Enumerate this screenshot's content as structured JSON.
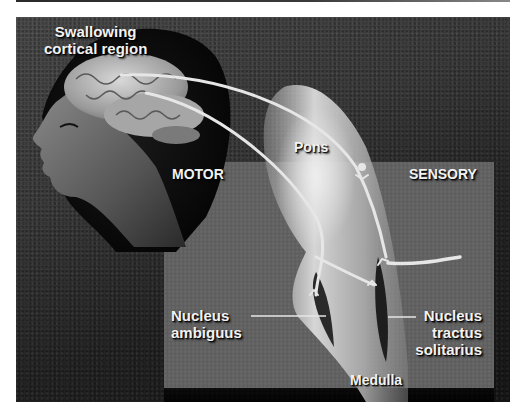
{
  "figure": {
    "title_label": [
      "Swallowing",
      "cortical region"
    ],
    "regions": {
      "motor": "MOTOR",
      "sensory": "SENSORY"
    },
    "structures": {
      "pons": "Pons",
      "medulla": "Medulla",
      "nucleus_ambiguus": [
        "Nucleus",
        "ambiguus"
      ],
      "nucleus_tractus_solitarius": [
        "Nucleus",
        "tractus",
        "solitarius"
      ]
    },
    "colors": {
      "background_texture": "#3b3b3b",
      "panel": "#5e5e5e",
      "brainstem": "#c8c8c8",
      "nerve_paths": "#e6e6e6",
      "label_text": "#f2f2f2"
    }
  }
}
